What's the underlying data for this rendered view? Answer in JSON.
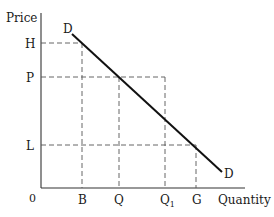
{
  "diagram": {
    "type": "demand-curve",
    "axes": {
      "y_label": "Price",
      "x_label": "Quantity",
      "origin_label": "0"
    },
    "price_levels": [
      {
        "label": "H",
        "y": 43
      },
      {
        "label": "P",
        "y": 77
      },
      {
        "label": "L",
        "y": 145
      }
    ],
    "quantity_levels": [
      {
        "label": "B",
        "x": 82
      },
      {
        "label": "Q",
        "x": 119
      },
      {
        "label": "Q",
        "subscript": "1",
        "x": 165
      },
      {
        "label": "G",
        "x": 196
      }
    ],
    "curve": {
      "label_start": "D",
      "label_end": "D",
      "color": "#111111"
    }
  }
}
